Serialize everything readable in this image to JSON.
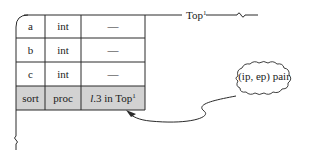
{
  "diagram": {
    "top_label": "Top",
    "top_label_sup": "1",
    "rows": [
      {
        "name": "a",
        "type": "int",
        "value": "—",
        "highlight": false
      },
      {
        "name": "b",
        "type": "int",
        "value": "—",
        "highlight": false
      },
      {
        "name": "c",
        "type": "int",
        "value": "—",
        "highlight": false
      },
      {
        "name": "sort",
        "type": "proc",
        "value_italic": "l",
        "value": ".3 in Top",
        "value_sup": "1",
        "highlight": true
      }
    ],
    "callout": {
      "label": "(ip, ep) pair"
    },
    "colors": {
      "line": "#2a2a2a",
      "highlight_fill": "#d2d2d2",
      "background": "#ffffff"
    }
  }
}
